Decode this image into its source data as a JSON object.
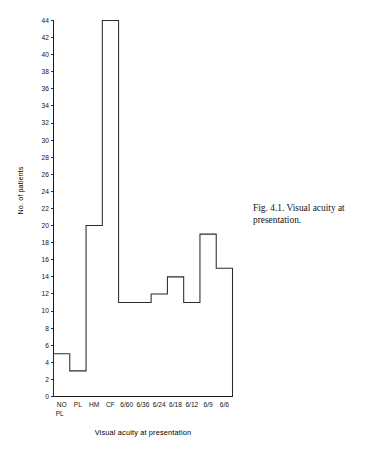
{
  "figure": {
    "caption": "Fig. 4.1. Visual acuity at presentation."
  },
  "chart_data": {
    "type": "bar",
    "render_style": "step-outline-histogram",
    "title": "",
    "subtitle": "",
    "xlabel": "Visual acuity at presentation",
    "ylabel": "No. of patients",
    "categories": [
      "NO PL",
      "PL",
      "HM",
      "CF",
      "6/60",
      "6/36",
      "6/24",
      "6/18",
      "6/12",
      "6/9",
      "6/6"
    ],
    "category_labels_multiline": [
      [
        "NO",
        "PL"
      ],
      [
        "PL"
      ],
      [
        "HM"
      ],
      [
        "CF"
      ],
      [
        "6/60"
      ],
      [
        "6/36"
      ],
      [
        "6/24"
      ],
      [
        "6/18"
      ],
      [
        "6/12"
      ],
      [
        "6/9"
      ],
      [
        "6/6"
      ]
    ],
    "values": [
      5,
      3,
      20,
      44,
      11,
      11,
      12,
      14,
      11,
      19,
      15
    ],
    "ylim": [
      0,
      44
    ],
    "ytick_step": 2,
    "yticks": [
      0,
      2,
      4,
      6,
      8,
      10,
      12,
      14,
      16,
      18,
      20,
      22,
      24,
      26,
      28,
      30,
      32,
      34,
      36,
      38,
      40,
      42,
      44
    ],
    "ytick_labels": [
      "0",
      "2",
      "4",
      "6",
      "8",
      "10",
      "12",
      "14",
      "16",
      "18",
      "20",
      "22",
      "24",
      "26",
      "28",
      "30",
      "32",
      "34",
      "36",
      "38",
      "40",
      "42",
      "44"
    ],
    "grid": false,
    "legend": null,
    "legend_position": "none",
    "line_color": "#2b2b2b",
    "axis_color": "#1a1a1a",
    "background_color": "#ffffff",
    "annotations": []
  }
}
